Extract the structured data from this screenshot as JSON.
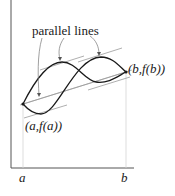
{
  "diagram": {
    "annotation": "parallel lines",
    "point_a_label": "(a,f(a))",
    "point_b_label": "(b,f(b))",
    "x_axis_labels": {
      "a": "a",
      "b": "b"
    },
    "colors": {
      "curve": "#1a1a1a",
      "axis": "#555555",
      "parallel_line": "#9a9a9a",
      "guide": "#d0d0d0"
    }
  }
}
